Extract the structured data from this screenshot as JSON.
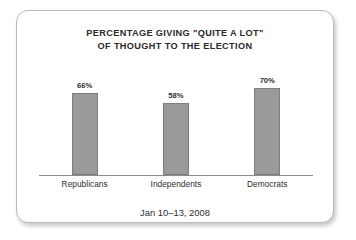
{
  "chart_data": {
    "type": "bar",
    "title": "PERCENTAGE GIVING \"QUITE A LOT\" OF THOUGHT TO THE ELECTION",
    "title_lines": [
      "PERCENTAGE GIVING \"QUITE A LOT\"",
      "OF THOUGHT TO THE ELECTION"
    ],
    "categories": [
      "Republicans",
      "Independents",
      "Democrats"
    ],
    "values": [
      66,
      58,
      70
    ],
    "value_labels": [
      "66%",
      "58%",
      "70%"
    ],
    "xlabel": "",
    "ylabel": "",
    "ylim": [
      0,
      100
    ],
    "grid": false,
    "legend": false,
    "footer": "Jan 10–13, 2008",
    "colors": {
      "bar_fill": "#9a9a9a",
      "bar_border": "#7d7d7d",
      "axis_line": "#8c8c8c",
      "text": "#2b2b2b",
      "card_border": "#b9b9b9",
      "card_background": "#ffffff"
    }
  }
}
